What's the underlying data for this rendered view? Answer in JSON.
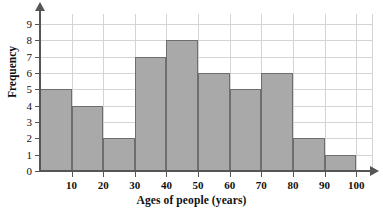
{
  "chart_data": {
    "type": "bar",
    "title": "",
    "xlabel": "Ages of people (years)",
    "ylabel": "Frequency",
    "categories": [
      "0-10",
      "10-20",
      "20-30",
      "30-40",
      "40-50",
      "50-60",
      "60-70",
      "70-80",
      "80-90",
      "90-100"
    ],
    "bin_edges": [
      0,
      10,
      20,
      30,
      40,
      50,
      60,
      70,
      80,
      90,
      100
    ],
    "values": [
      5,
      4,
      2,
      7,
      8,
      6,
      5,
      6,
      2,
      1
    ],
    "xticks": [
      10,
      20,
      30,
      40,
      50,
      60,
      70,
      80,
      90,
      100
    ],
    "yticks": [
      0,
      1,
      2,
      3,
      4,
      5,
      6,
      7,
      8,
      9
    ],
    "xlim": [
      0,
      105
    ],
    "ylim": [
      0,
      9.6
    ],
    "grid": true,
    "legend": false,
    "bar_fill": "#a9a9a9",
    "bar_stroke": "#6e6e6e",
    "grid_color": "#d4d4d4",
    "axis_color": "#555555"
  }
}
